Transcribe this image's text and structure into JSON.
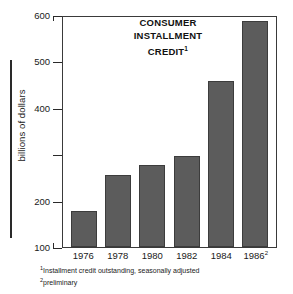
{
  "chart_data": {
    "type": "bar",
    "title_lines": [
      "CONSUMER",
      "INSTALLMENT",
      "CREDIT"
    ],
    "title_superscript": "1",
    "xlabel": "",
    "ylabel": "billions of dollars",
    "categories": [
      "1976",
      "1978",
      "1980",
      "1982",
      "1984",
      "1986"
    ],
    "category_superscripts": [
      "",
      "",
      "",
      "",
      "",
      "2"
    ],
    "values": [
      178,
      255,
      277,
      296,
      458,
      587
    ],
    "ylim": [
      100,
      600
    ],
    "yticks": [
      600,
      500,
      400,
      300,
      200,
      100
    ],
    "ytick_labels": [
      "600",
      "500",
      "400",
      "",
      "200",
      "100"
    ],
    "grid": false,
    "legend": null,
    "bar_color": "#5c5c5c",
    "axis_color": "#3a3a3a"
  },
  "notes": {
    "note1_marker": "1",
    "note1_text": "Installment credit outstanding, seasonally adjusted",
    "note2_marker": "2",
    "note2_text": "preliminary"
  }
}
